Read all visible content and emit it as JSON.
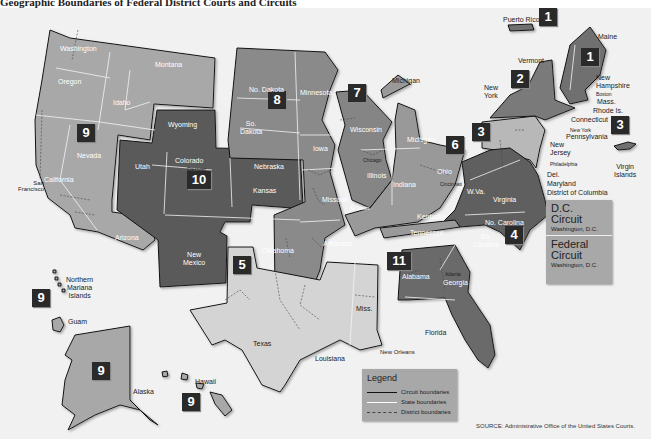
{
  "caption": "Geographic Boundaries of Federal District Courts and Circuits",
  "colors": {
    "background": "#f1f1f1",
    "circuit_1": "#707070",
    "circuit_2": "#7a7a7a",
    "circuit_3": "#b8b8b8",
    "circuit_4": "#5e5e5e",
    "circuit_5": "#d4d4d4",
    "circuit_6": "#999999",
    "circuit_7": "#858585",
    "circuit_8": "#8a8a8a",
    "circuit_9": "#a8a8a8",
    "circuit_10": "#5a5a5a",
    "circuit_11": "#6a6a6a",
    "badge": "#2a2a2a"
  },
  "circuits": [
    {
      "number": "1",
      "states": [
        "Maine",
        "New Hampshire",
        "Mass.",
        "Rhode Is.",
        "Puerto Rico"
      ]
    },
    {
      "number": "2",
      "states": [
        "Vermont",
        "New York",
        "Connecticut"
      ]
    },
    {
      "number": "3",
      "states": [
        "Pennsylvania",
        "New Jersey",
        "Del.",
        "Virgin Islands"
      ]
    },
    {
      "number": "4",
      "states": [
        "Maryland",
        "W.Va.",
        "Virginia",
        "No. Carolina",
        "So. Carolina"
      ]
    },
    {
      "number": "5",
      "states": [
        "Texas",
        "Louisiana",
        "Miss."
      ]
    },
    {
      "number": "6",
      "states": [
        "Michigan",
        "Ohio",
        "Kentucky",
        "Tennessee"
      ]
    },
    {
      "number": "7",
      "states": [
        "Wisconsin",
        "Illinois",
        "Indiana"
      ]
    },
    {
      "number": "8",
      "states": [
        "No. Dakota",
        "So. Dakota",
        "Nebraska",
        "Minnesota",
        "Iowa",
        "Missouri",
        "Arkansas"
      ]
    },
    {
      "number": "9",
      "states": [
        "Washington",
        "Oregon",
        "California",
        "Nevada",
        "Idaho",
        "Montana",
        "Arizona",
        "Alaska",
        "Hawaii",
        "Guam",
        "Northern Mariana Islands"
      ]
    },
    {
      "number": "10",
      "states": [
        "Wyoming",
        "Utah",
        "Colorado",
        "Kansas",
        "New Mexico",
        "Oklahoma"
      ]
    },
    {
      "number": "11",
      "states": [
        "Alabama",
        "Georgia",
        "Florida"
      ]
    }
  ],
  "state_labels": {
    "washington": "Washington",
    "oregon": "Oregon",
    "idaho": "Idaho",
    "montana": "Montana",
    "nevada": "Nevada",
    "california": "California",
    "arizona": "Arizona",
    "wyoming": "Wyoming",
    "utah": "Utah",
    "colorado": "Colorado",
    "kansas": "Kansas",
    "new_mexico": "New\nMexico",
    "oklahoma": "Oklahoma",
    "no_dakota": "No. Dakota",
    "so_dakota": "So.\nDakota",
    "nebraska": "Nebraska",
    "minnesota": "Minnesota",
    "iowa": "Iowa",
    "missouri": "Missouri",
    "arkansas": "Arkansas",
    "wisconsin": "Wisconsin",
    "illinois": "Illinois",
    "indiana": "Indiana",
    "michigan_upper": "Michigan",
    "michigan": "Michigan",
    "ohio": "Ohio",
    "kentucky": "Kentucky",
    "tennessee": "Tennessee",
    "texas": "Texas",
    "louisiana": "Louisiana",
    "miss": "Miss.",
    "alabama": "Alabama",
    "georgia": "Georgia",
    "florida": "Florida",
    "wva": "W.Va.",
    "virginia": "Virginia",
    "no_carolina": "No. Carolina",
    "so_carolina": "So.\nCarolina",
    "maine": "Maine",
    "vermont": "Vermont",
    "new_york": "New\nYork",
    "new_hampshire": "New\nHampshire",
    "mass": "Mass.",
    "rhode_is": "Rhode Is.",
    "connecticut": "Connecticut",
    "pennsylvania": "Pennsylvania",
    "new_jersey": "New\nJersey",
    "del": "Del.",
    "maryland": "Maryland",
    "dc": "District of Columbia",
    "puerto_rico": "Puerto Rico",
    "virgin_islands": "Virgin\nIslands",
    "alaska": "Alaska",
    "hawaii": "Hawaii",
    "guam": "Guam",
    "n_mariana": "Northern\nMariana\nIslands"
  },
  "cities": {
    "san_francisco": "San\nFrancisco",
    "denver": "Denver",
    "st_louis": "St. Louis",
    "chicago": "Chicago",
    "cincinnati": "Cincinnati",
    "new_orleans": "New Orleans",
    "atlanta": "Atlanta",
    "boston": "Boston",
    "new_york": "New York",
    "philadelphia": "Philadelphia",
    "washington_dc": "Washington D.C.",
    "richmond": "Richmond"
  },
  "dc_box": {
    "dc_circuit_title": "D.C.\nCircuit",
    "dc_circuit_location": "Washington, D.C.",
    "federal_circuit_title": "Federal\nCircuit",
    "federal_circuit_location": "Washington, D.C."
  },
  "legend": {
    "title": "Legend",
    "items": [
      {
        "label": "Circuit boundaries",
        "style": "solid",
        "color": "#111111"
      },
      {
        "label": "State boundaries",
        "style": "solid",
        "color": "#ffffff"
      },
      {
        "label": "District boundaries",
        "style": "dashed",
        "color": "#444444"
      }
    ]
  },
  "source": "SOURCE: Administrative Office of the United States Courts."
}
